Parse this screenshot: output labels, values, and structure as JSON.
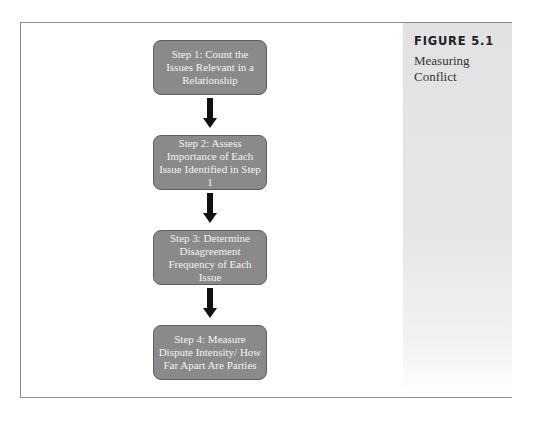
{
  "figure": {
    "label": "FIGURE 5.1",
    "caption": "Measuring Conflict"
  },
  "steps": [
    {
      "label": "Step 1: Count the Issues Relevant in a Relationship"
    },
    {
      "label": "Step 2: Assess Importance of Each Issue Identified in Step 1"
    },
    {
      "label": "Step 3: Determine Disagreement Frequency of Each Issue"
    },
    {
      "label": "Step 4: Measure Dispute Intensity/ How Far Apart Are Parties"
    }
  ],
  "colors": {
    "box_fill": "#8a8a8a",
    "box_text": "#f4f4f4",
    "arrow": "#111111",
    "panel": "#e4e4e4",
    "frame": "#8c8c8c"
  }
}
